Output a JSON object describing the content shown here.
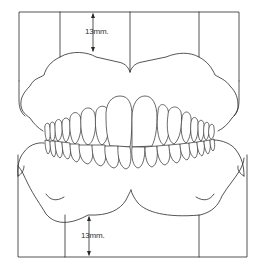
{
  "diagram": {
    "colors": {
      "line": "#2a2a2a",
      "background": "#ffffff"
    },
    "upper_measurement": {
      "label": "13mm.",
      "direction": "vertical"
    },
    "lower_measurement": {
      "label": "13mm.",
      "direction": "vertical"
    },
    "parts": [
      "upper-base-frame",
      "upper-gum",
      "upper-teeth",
      "lower-teeth",
      "lower-gum",
      "lower-base-frame"
    ]
  }
}
